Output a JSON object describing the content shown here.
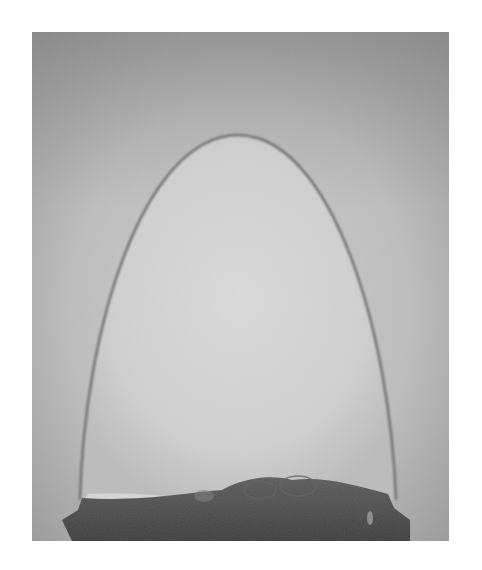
{
  "image": {
    "subject": "dome-shaped bubble on liquid surface",
    "alt": "Grayscale photograph of a tall parabolic dome bubble standing on a dark liquid pool",
    "colors": {
      "page_background": "#ffffff",
      "background_top": "#9a9a9a",
      "background_mid": "#c4c4c4",
      "bubble_interior": "#d6d6d6",
      "bubble_edge": "#6e6e6e",
      "liquid_pool": "#4a4a4a"
    }
  }
}
